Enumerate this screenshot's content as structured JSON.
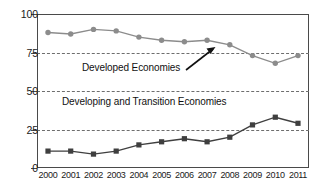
{
  "chart_data": {
    "type": "line",
    "title": "",
    "subtitle": "",
    "xlabel": "",
    "ylabel": "",
    "ylim": [
      0,
      100
    ],
    "yticks": [
      0,
      25,
      50,
      75,
      100
    ],
    "ytick_labels": [
      "0",
      "25",
      "50",
      "75",
      "100"
    ],
    "grid": "horizontal-dashed",
    "legend_position": "inline-annotation",
    "categories": [
      "2000",
      "2001",
      "2002",
      "2003",
      "2004",
      "2005",
      "2006",
      "2007",
      "2008",
      "2009",
      "2010",
      "2011"
    ],
    "x": [
      "2000",
      "2001",
      "2002",
      "2003",
      "2004",
      "2005",
      "2006",
      "2007",
      "2008",
      "2009",
      "2010",
      "2011"
    ],
    "series": [
      {
        "name": "Developed Economies",
        "marker": "circle",
        "color": "#8c8c8c",
        "values": [
          88,
          87,
          90,
          89,
          85,
          83,
          82,
          83,
          80,
          73,
          68,
          73
        ]
      },
      {
        "name": "Developing and Transition Economies",
        "marker": "square",
        "color": "#3f3f3f",
        "values": [
          11,
          11,
          9,
          11,
          15,
          17,
          19,
          17,
          20,
          28,
          33,
          29
        ]
      }
    ],
    "annotations": [
      {
        "name": "developed-economies-label",
        "text": "Developed Economies",
        "points_to": {
          "x": "2008",
          "y": 80
        },
        "arrow": true
      },
      {
        "name": "developing-economies-label",
        "text": "Developing and Transition Economies",
        "arrow": false
      }
    ]
  },
  "axis": {
    "y_labels": [
      "100",
      "75",
      "50",
      "25",
      "0"
    ],
    "x_labels": [
      "2000",
      "2001",
      "2002",
      "2003",
      "2004",
      "2005",
      "2006",
      "2007",
      "2008",
      "2009",
      "2010",
      "2011"
    ]
  },
  "annotations": {
    "developed": "Developed Economies",
    "developing": "Developing and Transition Economies"
  },
  "colors": {
    "developed_series": "#8c8c8c",
    "developing_series": "#3f3f3f",
    "frame": "#4a4a4a",
    "gridline": "#6e6e6e",
    "background": "#ffffff"
  }
}
